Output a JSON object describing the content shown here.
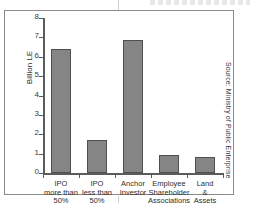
{
  "chart_data": {
    "type": "bar",
    "title": "",
    "xlabel": "",
    "ylabel": "Billion LE",
    "ylim": [
      0,
      8
    ],
    "yticks": [
      0,
      1,
      2,
      3,
      4,
      5,
      6,
      7,
      8
    ],
    "grid": false,
    "legend": false,
    "categories": [
      "IPO\nmore than\n50%",
      "IPO\nless than\n50%",
      "Anchor\nInvestor",
      "Employee\nShareholder\nAssociations",
      "Land\n&\nAssets"
    ],
    "values": [
      6.4,
      1.7,
      6.85,
      0.95,
      0.85
    ],
    "bar_color": "#858585",
    "bar_edge_color": "#4f4f4f",
    "axis_color": "#5c5c5c",
    "background_color": "#ffffff"
  },
  "annotations": {
    "source": "Source: Ministry of Public Enterprise"
  }
}
